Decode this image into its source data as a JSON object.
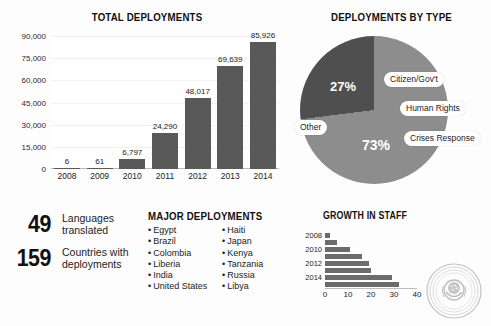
{
  "sections": {
    "total_deployments": {
      "title": "TOTAL DEPLOYMENTS"
    },
    "deployments_by_type": {
      "title": "DEPLOYMENTS BY TYPE"
    },
    "major_deployments": {
      "title": "MAJOR DEPLOYMENTS"
    },
    "growth_in_staff": {
      "title": "GROWTH IN STAFF"
    }
  },
  "key_stats": [
    {
      "number": "49",
      "label_line1": "Languages",
      "label_line2": "translated"
    },
    {
      "number": "159",
      "label_line1": "Countries with",
      "label_line2": "deployments"
    }
  ],
  "major_deployments": {
    "column_left": [
      "Egypt",
      "Brazil",
      "Colombia",
      "Liberia",
      "India",
      "United States"
    ],
    "column_right": [
      "Haiti",
      "Japan",
      "Kenya",
      "Tanzania",
      "Russia",
      "Libya"
    ]
  },
  "colors": {
    "bar_fill": "#595959",
    "pie_major": "#8d8d8d",
    "pie_other": "#4f4f4f",
    "growth_bar": "#6b6b6b",
    "text": "#1c1c1c"
  },
  "chart_data": [
    {
      "type": "bar",
      "title": "TOTAL DEPLOYMENTS",
      "orientation": "vertical",
      "categories": [
        "2008",
        "2009",
        "2010",
        "2011",
        "2012",
        "2013",
        "2014"
      ],
      "values": [
        6,
        61,
        6797,
        24290,
        48017,
        69639,
        85926
      ],
      "value_labels": [
        "6",
        "61",
        "6,797",
        "24,290",
        "48,017",
        "69,639",
        "85,926"
      ],
      "xlabel": "",
      "ylabel": "",
      "ylim": [
        0,
        90000
      ],
      "yticks": [
        0,
        15000,
        30000,
        45000,
        60000,
        75000,
        90000
      ],
      "ytick_labels": [
        "0",
        "15,000",
        "30,000",
        "45,000",
        "60,000",
        "75,000",
        "90,000"
      ],
      "grid": true,
      "legend": false
    },
    {
      "type": "pie",
      "title": "DEPLOYMENTS BY TYPE",
      "slices": [
        {
          "label": "Crises Response / Human Rights / Citizen-Gov't",
          "value": 73,
          "display": "73%",
          "color": "#8d8d8d"
        },
        {
          "label": "Other",
          "value": 27,
          "display": "27%",
          "color": "#4f4f4f"
        }
      ],
      "callouts": [
        "Citizen/Gov't",
        "Human Rights",
        "Crises Response",
        "Other"
      ],
      "pct_major": "73%",
      "pct_other": "27%",
      "legend": "callout-pills"
    },
    {
      "type": "bar",
      "title": "GROWTH IN STAFF",
      "orientation": "horizontal",
      "categories": [
        "2008",
        "2009",
        "2010",
        "2011",
        "2012",
        "2013",
        "2014",
        "2015"
      ],
      "tick_labels_shown": [
        "2008",
        "2010",
        "2012",
        "2014"
      ],
      "values": [
        2,
        5,
        11,
        16,
        19,
        20,
        29,
        32
      ],
      "xlabel": "",
      "ylabel": "",
      "xlim": [
        0,
        40
      ],
      "xticks": [
        0,
        10,
        20,
        30,
        40
      ],
      "xtick_labels": [
        "0",
        "10",
        "20",
        "30",
        "40"
      ],
      "grid": false,
      "legend": false
    }
  ]
}
